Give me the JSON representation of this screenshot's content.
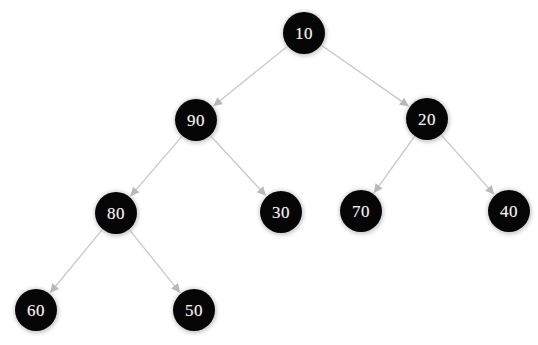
{
  "diagram": {
    "type": "binary-tree",
    "background_color": "#ffffff",
    "node_fill_color": "#060606",
    "node_text_color": "#f2f2f2",
    "edge_color": "#c8c8c8",
    "node_radius": 21,
    "nodes": [
      {
        "id": "n10",
        "label": "10",
        "cx": 304,
        "cy": 33,
        "r": 21,
        "level": 0
      },
      {
        "id": "n90",
        "label": "90",
        "cx": 196,
        "cy": 120,
        "r": 21,
        "level": 1
      },
      {
        "id": "n20",
        "label": "20",
        "cx": 427,
        "cy": 119,
        "r": 21,
        "level": 1
      },
      {
        "id": "n80",
        "label": "80",
        "cx": 116,
        "cy": 213,
        "r": 21,
        "level": 2
      },
      {
        "id": "n30",
        "label": "30",
        "cx": 281,
        "cy": 212,
        "r": 21,
        "level": 2
      },
      {
        "id": "n70",
        "label": "70",
        "cx": 361,
        "cy": 211,
        "r": 21,
        "level": 2
      },
      {
        "id": "n40",
        "label": "40",
        "cx": 509,
        "cy": 211,
        "r": 21,
        "level": 2
      },
      {
        "id": "n60",
        "label": "60",
        "cx": 36,
        "cy": 310,
        "r": 21,
        "level": 3
      },
      {
        "id": "n50",
        "label": "50",
        "cx": 194,
        "cy": 310,
        "r": 21,
        "level": 3
      }
    ],
    "edges": [
      {
        "id": "e-10-90",
        "from": "n10",
        "to": "n90",
        "from_label": "10",
        "to_label": "90",
        "x1": 304,
        "y1": 33,
        "x2": 196,
        "y2": 120
      },
      {
        "id": "e-10-20",
        "from": "n10",
        "to": "n20",
        "from_label": "10",
        "to_label": "20",
        "x1": 304,
        "y1": 33,
        "x2": 427,
        "y2": 119
      },
      {
        "id": "e-90-80",
        "from": "n90",
        "to": "n80",
        "from_label": "90",
        "to_label": "80",
        "x1": 196,
        "y1": 120,
        "x2": 116,
        "y2": 213
      },
      {
        "id": "e-90-30",
        "from": "n90",
        "to": "n30",
        "from_label": "90",
        "to_label": "30",
        "x1": 196,
        "y1": 120,
        "x2": 281,
        "y2": 212
      },
      {
        "id": "e-20-70",
        "from": "n20",
        "to": "n70",
        "from_label": "20",
        "to_label": "70",
        "x1": 427,
        "y1": 119,
        "x2": 361,
        "y2": 211
      },
      {
        "id": "e-20-40",
        "from": "n20",
        "to": "n40",
        "from_label": "20",
        "to_label": "40",
        "x1": 427,
        "y1": 119,
        "x2": 509,
        "y2": 211
      },
      {
        "id": "e-80-60",
        "from": "n80",
        "to": "n60",
        "from_label": "80",
        "to_label": "60",
        "x1": 116,
        "y1": 213,
        "x2": 36,
        "y2": 310
      },
      {
        "id": "e-80-50",
        "from": "n80",
        "to": "n50",
        "from_label": "80",
        "to_label": "50",
        "x1": 116,
        "y1": 213,
        "x2": 194,
        "y2": 310
      }
    ]
  }
}
